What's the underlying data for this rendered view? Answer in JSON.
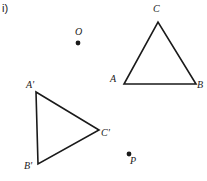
{
  "figure": {
    "item_label": "i)",
    "background_color": "#ffffff",
    "stroke_color": "#1a1a1a",
    "label_color": "#1a1a1a",
    "stroke_width": 1.6,
    "width": 207,
    "height": 181
  },
  "triangles": [
    {
      "name": "triangle-ABC",
      "vertices": [
        {
          "label": "A",
          "x": 124,
          "y": 84
        },
        {
          "label": "B",
          "x": 196,
          "y": 84
        },
        {
          "label": "C",
          "x": 158,
          "y": 22
        }
      ]
    },
    {
      "name": "triangle-A-prime-B-prime-C-prime",
      "vertices": [
        {
          "label": "A'",
          "x": 36,
          "y": 92
        },
        {
          "label": "B'",
          "x": 38,
          "y": 164
        },
        {
          "label": "C'",
          "x": 99,
          "y": 130
        }
      ]
    }
  ],
  "points": [
    {
      "label": "O",
      "x": 78,
      "y": 43,
      "radius": 2.4
    },
    {
      "label": "P",
      "x": 129,
      "y": 154,
      "radius": 2.4
    }
  ],
  "labels": {
    "C": "C",
    "A": "A",
    "B": "B",
    "A_prime": "A'",
    "B_prime": "B'",
    "C_prime": "C'",
    "O": "O",
    "P": "P"
  }
}
